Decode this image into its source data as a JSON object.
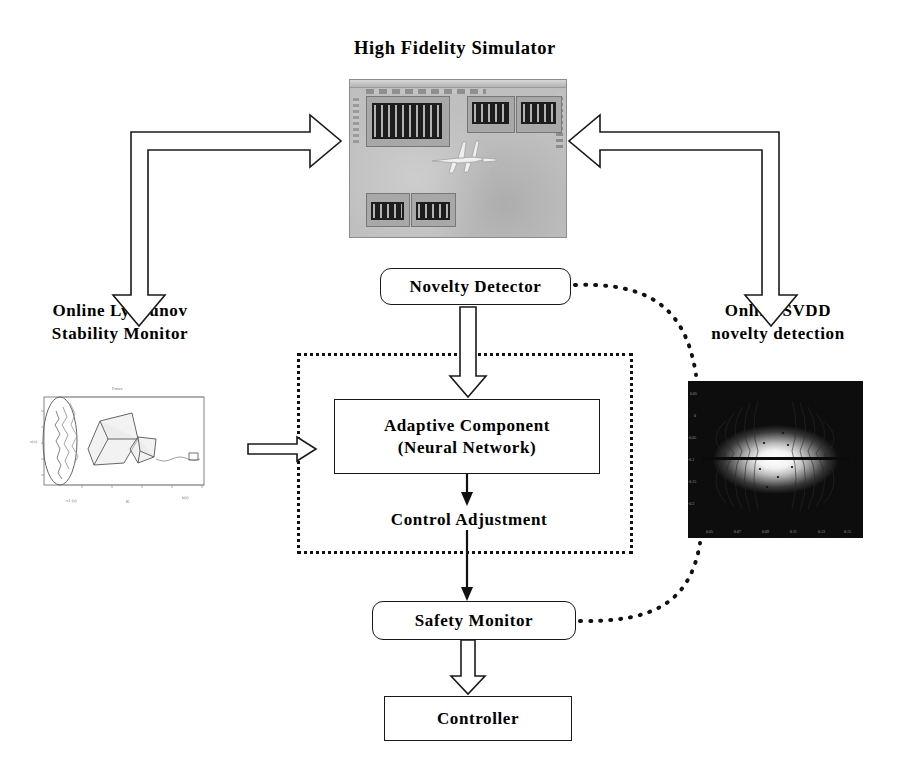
{
  "diagram": {
    "title": "High Fidelity Simulator",
    "nodes": {
      "novelty_detector": "Novelty Detector",
      "adaptive_component_line1": "Adaptive Component",
      "adaptive_component_line2": "(Neural Network)",
      "control_adjustment": "Control Adjustment",
      "safety_monitor": "Safety Monitor",
      "controller": "Controller"
    },
    "captions": {
      "lyapunov_line1": "Online Lyapunov",
      "lyapunov_line2": "Stability Monitor",
      "svdd_line1": "Online SVDD",
      "svdd_line2": "novelty detection"
    },
    "images": {
      "simulator_screenshot": "flight-simulator-window-screenshot",
      "lyapunov_plot": "lyapunov-stability-region-3d-plot",
      "svdd_plot": "svdd-contour-density-plot"
    },
    "connectors": [
      {
        "name": "simulator-to-lyapunov",
        "style": "hollow-block-elbow-arrow",
        "from": "High Fidelity Simulator",
        "to": "Online Lyapunov Stability Monitor"
      },
      {
        "name": "simulator-to-svdd",
        "style": "hollow-block-elbow-arrow",
        "from": "High Fidelity Simulator",
        "to": "Online SVDD novelty detection"
      },
      {
        "name": "lyapunov-to-adaptive",
        "style": "hollow-block-arrow",
        "from": "Online Lyapunov Stability Monitor",
        "to": "Adaptive Component"
      },
      {
        "name": "novelty-to-adaptive",
        "style": "hollow-block-arrow",
        "from": "Novelty Detector",
        "to": "Adaptive Component"
      },
      {
        "name": "adaptive-to-control-adjustment",
        "style": "thin-solid-arrow",
        "from": "Adaptive Component",
        "to": "Control Adjustment"
      },
      {
        "name": "control-adjustment-to-safety",
        "style": "thin-solid-arrow",
        "from": "Control Adjustment",
        "to": "Safety Monitor"
      },
      {
        "name": "safety-to-controller",
        "style": "hollow-block-arrow",
        "from": "Safety Monitor",
        "to": "Controller"
      },
      {
        "name": "novelty-to-svdd",
        "style": "dotted-curve",
        "from": "Novelty Detector",
        "to": "Online SVDD novelty detection"
      },
      {
        "name": "safety-to-svdd",
        "style": "dotted-curve",
        "from": "Safety Monitor",
        "to": "Online SVDD novelty detection"
      }
    ],
    "colors": {
      "stroke": "#1a1a1a",
      "background": "#ffffff",
      "dotted_group_border": "#111111",
      "simulator_window": "#bfbfbf",
      "svdd_background": "#0b0b0b"
    }
  }
}
